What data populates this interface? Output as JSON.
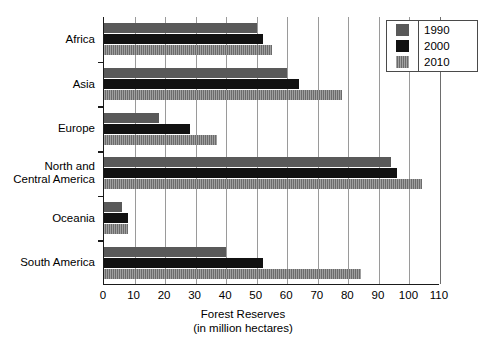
{
  "chart_data": {
    "type": "bar",
    "orientation": "horizontal",
    "title": "",
    "xlabel": "Forest Reserves\n(in million hectares)",
    "xlabel_line1": "Forest Reserves",
    "xlabel_line2": "(in million hectares)",
    "ylabel": "",
    "categories": [
      "Africa",
      "Asia",
      "Europe",
      "North and\nCentral America",
      "Oceania",
      "South America"
    ],
    "series": [
      {
        "name": "1990",
        "color": "#595959",
        "values": [
          50,
          60,
          18,
          94,
          6,
          40
        ]
      },
      {
        "name": "2000",
        "color": "#111111",
        "values": [
          52,
          64,
          28,
          96,
          8,
          52
        ]
      },
      {
        "name": "2010",
        "color": "#777777",
        "values": [
          55,
          78,
          37,
          104,
          8,
          84
        ]
      }
    ],
    "xlim": [
      0,
      110
    ],
    "xticks": [
      0,
      10,
      20,
      30,
      40,
      50,
      60,
      70,
      80,
      90,
      100,
      110
    ],
    "xtick_labels": [
      "0",
      "10",
      "20",
      "30",
      "40",
      "50",
      "60",
      "70",
      "80",
      "90",
      "100",
      "110"
    ],
    "grid": true,
    "grid_axis": "x",
    "legend_position": "top-right",
    "legend_entries": [
      "1990",
      "2000",
      "2010"
    ]
  }
}
